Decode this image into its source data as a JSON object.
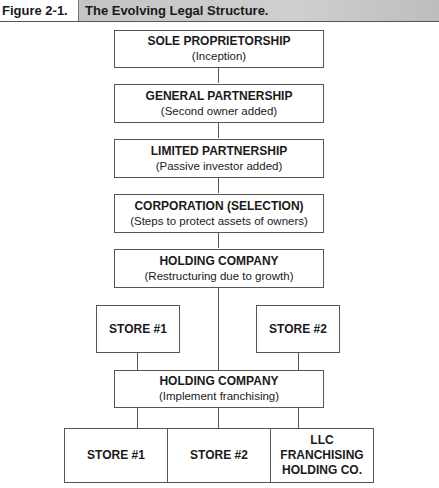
{
  "figure": {
    "label": "Figure 2-1.",
    "title": "The Evolving Legal Structure."
  },
  "nodes": {
    "sole_proprietorship": {
      "title": "SOLE PROPRIETORSHIP",
      "subtitle": "(Inception)"
    },
    "general_partnership": {
      "title": "GENERAL PARTNERSHIP",
      "subtitle": "(Second owner added)"
    },
    "limited_partnership": {
      "title": "LIMITED PARTNERSHIP",
      "subtitle": "(Passive investor added)"
    },
    "corporation": {
      "title": "CORPORATION (SELECTION)",
      "subtitle": "(Steps to protect assets of owners)"
    },
    "holding_company_1": {
      "title": "HOLDING COMPANY",
      "subtitle": "(Restructuring due to growth)"
    },
    "store1_upper": {
      "title": "STORE #1"
    },
    "store2_upper": {
      "title": "STORE #2"
    },
    "holding_company_2": {
      "title": "HOLDING COMPANY",
      "subtitle": "(Implement franchising)"
    },
    "store1_lower": {
      "title": "STORE #1"
    },
    "store2_lower": {
      "title": "STORE #2"
    },
    "llc": {
      "title_lines": [
        "LLC",
        "FRANCHISING",
        "HOLDING CO."
      ]
    }
  },
  "edges": [
    [
      "sole_proprietorship",
      "general_partnership"
    ],
    [
      "general_partnership",
      "limited_partnership"
    ],
    [
      "limited_partnership",
      "corporation"
    ],
    [
      "corporation",
      "holding_company_1"
    ],
    [
      "holding_company_1",
      "holding_company_2"
    ],
    [
      "store1_upper",
      "holding_company_2"
    ],
    [
      "store2_upper",
      "holding_company_2"
    ],
    [
      "holding_company_2",
      "store1_lower"
    ],
    [
      "holding_company_2",
      "store2_lower"
    ],
    [
      "holding_company_2",
      "llc"
    ]
  ]
}
